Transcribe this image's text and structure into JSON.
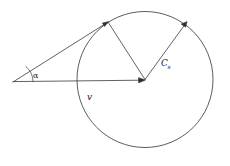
{
  "figure": {
    "kind": "geometry-diagram",
    "width": 230,
    "height": 166,
    "background_color": "#ffffff",
    "stroke_color": "#3a3a3a",
    "circle_stroke_color": "#4a4a4a",
    "arrowhead_color": "#2e2e2e",
    "label_color": "#1a1a1a"
  },
  "geometry": {
    "circle": {
      "cx": 145,
      "cy": 79.5,
      "r": 68
    },
    "apex": {
      "x": 13,
      "y": 82
    },
    "tangent_point": {
      "x": 108,
      "y": 22
    },
    "cs_tip": {
      "x": 187,
      "y": 22
    },
    "v_tip": {
      "x": 145,
      "y": 80
    },
    "angle_arc_radius": 20
  },
  "labels": {
    "alpha": {
      "text": "α",
      "x": 33,
      "y": 78,
      "meaning": "mach-angle"
    },
    "v": {
      "text": "v",
      "x": 87,
      "y": 100,
      "meaning": "velocity-vector-label"
    },
    "cs": {
      "base": "C",
      "sub": "s",
      "x": 161,
      "y": 66,
      "meaning": "sound-speed-vector-label"
    }
  }
}
